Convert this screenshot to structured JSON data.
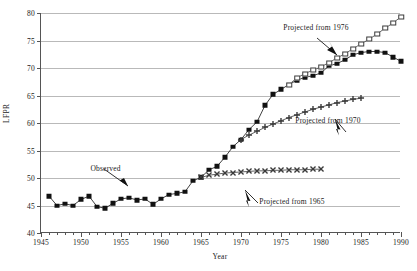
{
  "chart_data": {
    "type": "line",
    "title": "",
    "xlabel": "Year",
    "ylabel": "LFPR",
    "xlim": [
      1945,
      1990
    ],
    "ylim": [
      40,
      80
    ],
    "xticks": [
      1945,
      1950,
      1955,
      1960,
      1965,
      1970,
      1975,
      1980,
      1985,
      1990
    ],
    "yticks": [
      40,
      45,
      50,
      55,
      60,
      65,
      70,
      75,
      80
    ],
    "grid": true,
    "legend": "none",
    "annotations": [
      {
        "text": "Observed",
        "x": 1953.2,
        "y": 51.6
      },
      {
        "text": "Projected from 1976",
        "x": 1979.5,
        "y": 77.3
      },
      {
        "text": "Projected from 1970",
        "x": 1981.0,
        "y": 60.4
      },
      {
        "text": "Projected from 1965",
        "x": 1976.5,
        "y": 45.6
      }
    ],
    "series": [
      {
        "name": "Observed",
        "marker": "filled-square",
        "x": [
          1946,
          1947,
          1948,
          1949,
          1950,
          1951,
          1952,
          1953,
          1954,
          1955,
          1956,
          1957,
          1958,
          1959,
          1960,
          1961,
          1962,
          1963,
          1964,
          1965,
          1966,
          1967,
          1968,
          1969,
          1970,
          1971,
          1972,
          1973,
          1974,
          1975,
          1976,
          1977,
          1978,
          1979,
          1980,
          1981,
          1982,
          1983,
          1984,
          1985,
          1986,
          1987,
          1988,
          1989,
          1990
        ],
        "values": [
          46.7,
          45.0,
          45.3,
          45.0,
          46.1,
          46.7,
          44.8,
          44.5,
          45.4,
          46.2,
          46.4,
          46.0,
          46.2,
          45.2,
          46.2,
          47.0,
          47.2,
          47.5,
          49.5,
          50.1,
          51.5,
          52.1,
          53.8,
          55.7,
          57.0,
          58.8,
          60.2,
          63.2,
          65.2,
          66.1,
          67.0,
          67.8,
          68.3,
          68.6,
          69.1,
          70.4,
          70.8,
          71.5,
          72.4,
          72.8,
          73.0,
          73.0,
          72.8,
          72.0,
          71.2
        ]
      },
      {
        "name": "Projected from 1965",
        "marker": "cross",
        "x": [
          1965,
          1966,
          1967,
          1968,
          1969,
          1970,
          1971,
          1972,
          1973,
          1974,
          1975,
          1976,
          1977,
          1978,
          1979,
          1980
        ],
        "values": [
          50.1,
          50.5,
          50.7,
          50.9,
          51.0,
          51.1,
          51.2,
          51.3,
          51.3,
          51.4,
          51.4,
          51.5,
          51.5,
          51.5,
          51.6,
          51.6
        ]
      },
      {
        "name": "Projected from 1970",
        "marker": "plus",
        "x": [
          1970,
          1971,
          1972,
          1973,
          1974,
          1975,
          1976,
          1977,
          1978,
          1979,
          1980,
          1981,
          1982,
          1983,
          1984,
          1985
        ],
        "values": [
          57.0,
          57.8,
          58.5,
          59.2,
          59.8,
          60.4,
          61.0,
          61.5,
          62.0,
          62.5,
          62.9,
          63.3,
          63.7,
          64.0,
          64.3,
          64.5
        ]
      },
      {
        "name": "Projected from 1976",
        "marker": "open-square",
        "x": [
          1976,
          1977,
          1978,
          1979,
          1980,
          1981,
          1982,
          1983,
          1984,
          1985,
          1986,
          1987,
          1988,
          1989,
          1990
        ],
        "values": [
          67.0,
          68.2,
          69.0,
          69.6,
          70.2,
          71.0,
          71.8,
          72.6,
          73.5,
          74.4,
          75.2,
          76.2,
          77.2,
          78.2,
          79.3
        ]
      }
    ],
    "colors": {
      "observed": "#111111",
      "projection": "#3a3a3a",
      "grid": "#b9b9b9",
      "axis": "#555555"
    }
  }
}
